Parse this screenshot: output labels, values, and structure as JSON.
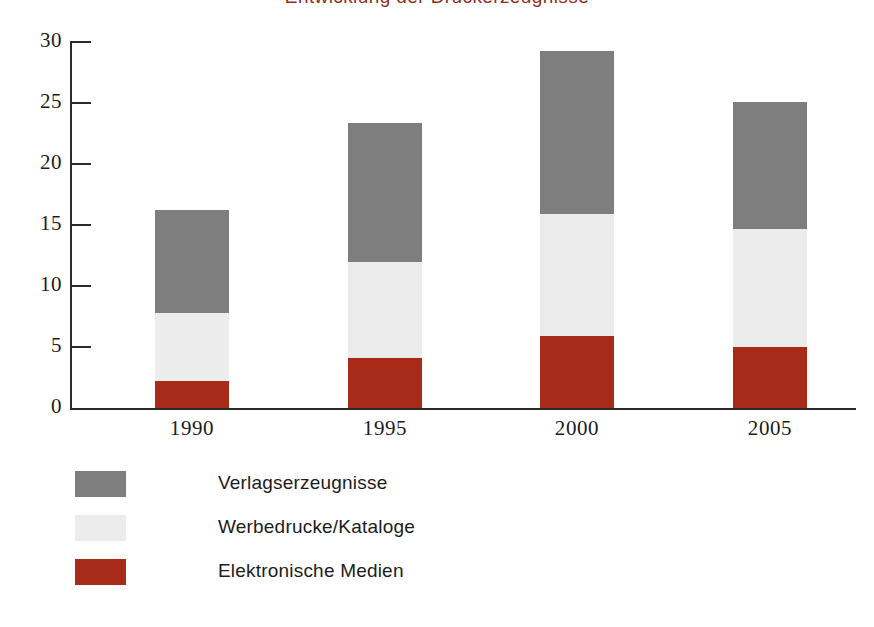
{
  "chart_data": {
    "type": "bar",
    "subtype": "stacked-bar",
    "title": "Entwicklung der Druckerzeugnisse",
    "title_visible_fragment": "g",
    "xlabel": "",
    "ylabel": "",
    "categories": [
      "1990",
      "1995",
      "2000",
      "2005"
    ],
    "ylim": [
      0,
      30
    ],
    "yticks": [
      0,
      5,
      10,
      15,
      20,
      25,
      30
    ],
    "ytick_labels": [
      "0",
      "5",
      "10",
      "15",
      "20",
      "25",
      "30"
    ],
    "grid": false,
    "legend_position": "below-left",
    "stack_order_bottom_to_top": [
      "Elektronische Medien",
      "Werbedrucke/Kataloge",
      "Verlagserzeugnisse"
    ],
    "series": [
      {
        "name": "Verlagserzeugnisse",
        "color": "#7e7e7e",
        "values": [
          8.4,
          11.4,
          13.4,
          10.4
        ]
      },
      {
        "name": "Werbedrucke/Kataloge",
        "color": "#ececec",
        "values": [
          5.6,
          7.9,
          10.0,
          9.7
        ]
      },
      {
        "name": "Elektronische Medien",
        "color": "#a82a18",
        "values": [
          2.2,
          4.1,
          5.9,
          5.0
        ]
      }
    ],
    "totals": [
      16.2,
      23.4,
      29.3,
      25.1
    ],
    "cumulative_tops": {
      "Elektronische Medien": [
        2.2,
        4.1,
        5.9,
        5.0
      ],
      "Werbedrucke/Kataloge": [
        7.8,
        12.0,
        15.9,
        14.7
      ],
      "Verlagserzeugnisse": [
        16.2,
        23.4,
        29.3,
        25.1
      ]
    }
  },
  "axis": {
    "y_ticks": [
      {
        "label": "30",
        "value": 30
      },
      {
        "label": "25",
        "value": 25
      },
      {
        "label": "20",
        "value": 20
      },
      {
        "label": "15",
        "value": 15
      },
      {
        "label": "10",
        "value": 10
      },
      {
        "label": "5",
        "value": 5
      },
      {
        "label": "0",
        "value": 0
      }
    ],
    "x_ticks": [
      "1990",
      "1995",
      "2000",
      "2005"
    ]
  },
  "legend": {
    "items": [
      {
        "label": "Verlagserzeugnisse",
        "color": "#7e7e7e"
      },
      {
        "label": "Werbedrucke/Kataloge",
        "color": "#ececec"
      },
      {
        "label": "Elektronische Medien",
        "color": "#a82a18"
      }
    ]
  },
  "colors": {
    "dark_gray": "#7e7e7e",
    "light_gray": "#ececec",
    "red": "#a82a18",
    "axis": "#2b2b2b",
    "text": "#1c1c1c",
    "title": "#8c2f22",
    "background": "#ffffff"
  },
  "geometry": {
    "baseline_y": 408,
    "top_y": 42,
    "px_per_unit": 12.2,
    "bar_width": 74,
    "bar_left_x": [
      155,
      348,
      540,
      733
    ]
  }
}
